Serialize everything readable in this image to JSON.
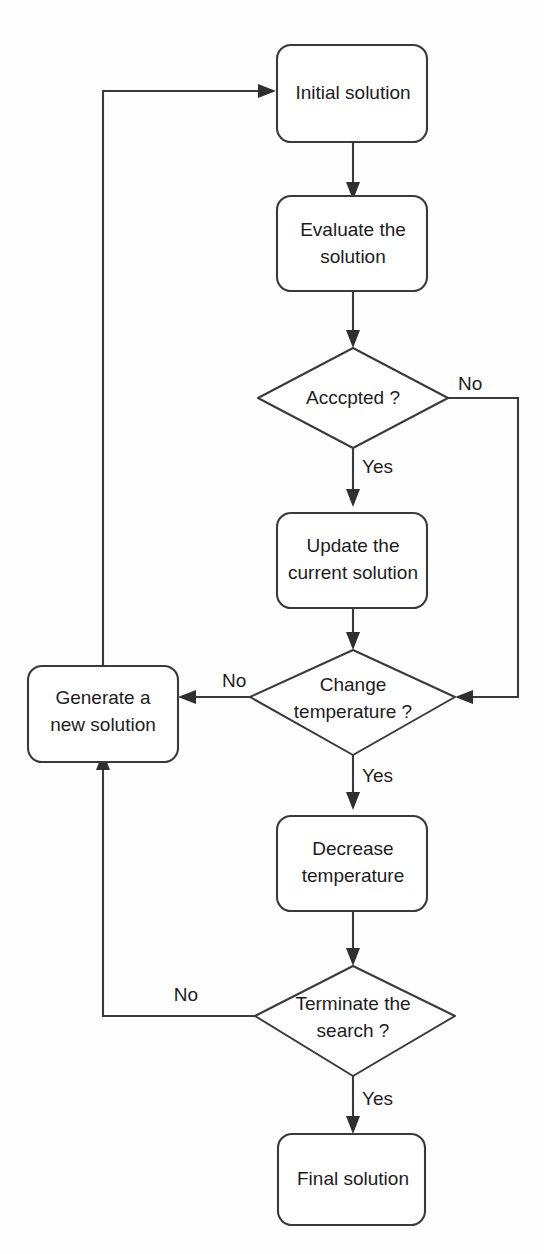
{
  "diagram": {
    "type": "flowchart",
    "background_color": "#ffffff",
    "line_color": "#3a3a3a",
    "text_color": "#1c1c1c",
    "nodes": [
      {
        "id": "initial-solution",
        "shape": "rounded-rectangle",
        "label": "Initial solution",
        "lines": [
          "Initial solution"
        ]
      },
      {
        "id": "evaluate-solution",
        "shape": "rounded-rectangle",
        "label": "Evaluate the solution",
        "lines": [
          "Evaluate the",
          "solution"
        ]
      },
      {
        "id": "accepted-decision",
        "shape": "diamond",
        "label": "Acccpted ?",
        "lines": [
          "Acccpted ?"
        ]
      },
      {
        "id": "update-current-solution",
        "shape": "rounded-rectangle",
        "label": "Update the current solution",
        "lines": [
          "Update the",
          "current solution"
        ]
      },
      {
        "id": "change-temperature-decision",
        "shape": "diamond",
        "label": "Change temperature ?",
        "lines": [
          "Change",
          "temperature ?"
        ]
      },
      {
        "id": "generate-new-solution",
        "shape": "rounded-rectangle",
        "label": "Generate a new solution",
        "lines": [
          "Generate a",
          "new solution"
        ]
      },
      {
        "id": "decrease-temperature",
        "shape": "rounded-rectangle",
        "label": "Decrease temperature",
        "lines": [
          "Decrease",
          "temperature"
        ]
      },
      {
        "id": "terminate-search-decision",
        "shape": "diamond",
        "label": "Terminate the search ?",
        "lines": [
          "Terminate the",
          "search ?"
        ]
      },
      {
        "id": "final-solution",
        "shape": "rounded-rectangle",
        "label": "Final solution",
        "lines": [
          "Final solution"
        ]
      }
    ],
    "edge_labels": {
      "accepted_no": "No",
      "accepted_yes": "Yes",
      "change_temperature_no": "No",
      "change_temperature_yes": "Yes",
      "terminate_no": "No",
      "terminate_yes": "Yes"
    },
    "edges": [
      {
        "from": "initial-solution",
        "to": "evaluate-solution",
        "label": ""
      },
      {
        "from": "evaluate-solution",
        "to": "accepted-decision",
        "label": ""
      },
      {
        "from": "accepted-decision",
        "to": "update-current-solution",
        "label": "Yes"
      },
      {
        "from": "accepted-decision",
        "to": "change-temperature-decision",
        "label": "No"
      },
      {
        "from": "update-current-solution",
        "to": "change-temperature-decision",
        "label": ""
      },
      {
        "from": "change-temperature-decision",
        "to": "generate-new-solution",
        "label": "No"
      },
      {
        "from": "change-temperature-decision",
        "to": "decrease-temperature",
        "label": "Yes"
      },
      {
        "from": "decrease-temperature",
        "to": "terminate-search-decision",
        "label": ""
      },
      {
        "from": "terminate-search-decision",
        "to": "generate-new-solution",
        "label": "No"
      },
      {
        "from": "terminate-search-decision",
        "to": "final-solution",
        "label": "Yes"
      },
      {
        "from": "generate-new-solution",
        "to": "initial-solution",
        "label": ""
      }
    ]
  }
}
